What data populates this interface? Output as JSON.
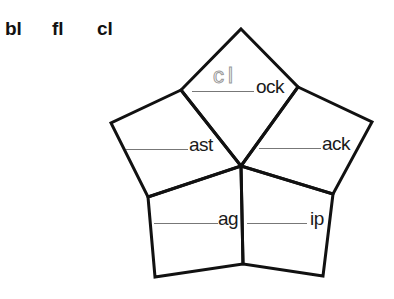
{
  "worksheet": {
    "blends": [
      "bl",
      "fl",
      "cl"
    ],
    "pentagon_sections": [
      {
        "position": "top",
        "answer_hint": "cl",
        "ending": "ock"
      },
      {
        "position": "upper-left",
        "answer_hint": "",
        "ending": "ast"
      },
      {
        "position": "upper-right",
        "answer_hint": "",
        "ending": "ack"
      },
      {
        "position": "lower-left",
        "answer_hint": "",
        "ending": "ag"
      },
      {
        "position": "lower-right",
        "answer_hint": "",
        "ending": "ip"
      }
    ]
  },
  "colors": {
    "outline": "#111111",
    "blank_line": "#777777",
    "trace_letters": "#999999"
  }
}
